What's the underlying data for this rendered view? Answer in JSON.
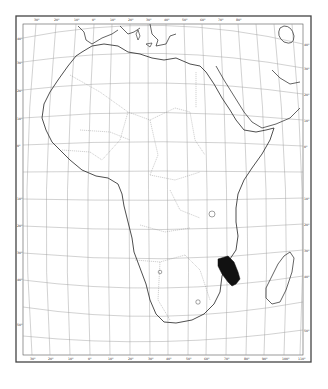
{
  "map": {
    "type": "outline map",
    "subject": "Africa",
    "style": "black and white line map with graticule",
    "colors": {
      "background": "#ffffff",
      "frame": "#444444",
      "graticule": "#9a9a9a",
      "coastline": "#222222",
      "borders": "#8a8a8a",
      "highlight": "#111111"
    },
    "graticule_labels": {
      "top": [
        "30°",
        "20°",
        "10°",
        "0°",
        "10°",
        "20°",
        "30°",
        "40°",
        "50°",
        "60°",
        "70°",
        "80°"
      ],
      "bottom": [
        "30°",
        "20°",
        "10°",
        "0°",
        "10°",
        "20°",
        "30°",
        "40°",
        "50°",
        "60°",
        "70°",
        "80°",
        "90°",
        "100°",
        "110°"
      ],
      "left": [
        "40°",
        "30°",
        "20°",
        "10°",
        "0°",
        "10°",
        "20°",
        "30°",
        "40°",
        "50°"
      ],
      "right": [
        "40°",
        "30°",
        "20°",
        "10°",
        "0°",
        "10°",
        "20°",
        "30°",
        "40°",
        "50°"
      ]
    },
    "highlighted_region": {
      "label": "shaded area in south-east Africa (Mozambique / Zimbabwe / Malawi region)",
      "fill": "#111111"
    },
    "features": [
      "Africa",
      "Madagascar",
      "Arabian Peninsula",
      "Iberian Peninsula",
      "Mediterranean Sea",
      "Red Sea",
      "Persian Gulf",
      "Sardinia",
      "Sicily"
    ]
  }
}
